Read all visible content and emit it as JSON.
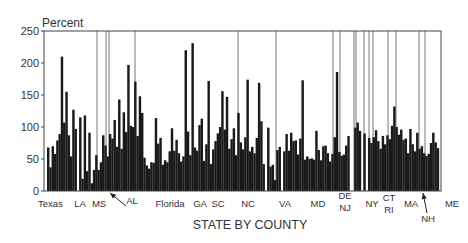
{
  "chart_data": {
    "type": "bar",
    "title": "",
    "xlabel": "STATE BY COUNTY",
    "ylabel": "Percent",
    "ylim": [
      0,
      250
    ],
    "yticks": [
      0,
      50,
      100,
      150,
      200,
      250
    ],
    "grid": false,
    "bar_color": "#1a1a1a",
    "divider_color": "#555555",
    "groups": [
      {
        "name": "Texas",
        "values": [
          68,
          37,
          70,
          58,
          79,
          89,
          210,
          107,
          155,
          87,
          54
        ]
      },
      {
        "name": "LA",
        "values": [
          127,
          97,
          0,
          115,
          19,
          118,
          31,
          91,
          12
        ]
      },
      {
        "name": "MS",
        "values": [
          33,
          56,
          33
        ]
      },
      {
        "name": "AL",
        "values": [
          45,
          87,
          71,
          54,
          89,
          82,
          111,
          69,
          143,
          66,
          123,
          92,
          197,
          102,
          100,
          171,
          86,
          148,
          122,
          52,
          40,
          35,
          45,
          44,
          114
        ]
      },
      {
        "name": "Florida",
        "values": [
          74,
          83,
          41,
          48,
          45,
          62,
          98,
          63,
          80,
          59,
          46,
          54,
          220,
          93,
          56
        ]
      },
      {
        "name": "GA",
        "values": [
          231,
          68,
          63,
          103,
          113,
          47,
          73
        ]
      },
      {
        "name": "SC",
        "values": [
          172,
          42,
          65,
          78,
          90,
          100,
          156,
          96,
          147,
          66
        ]
      },
      {
        "name": "NC",
        "values": [
          81,
          98,
          56,
          122,
          76,
          65,
          84,
          174,
          62,
          69,
          59,
          83,
          169,
          109,
          42
        ]
      },
      {
        "name": "VA",
        "values": [
          0,
          99,
          38,
          41,
          17,
          64,
          69,
          0,
          62,
          89,
          63
        ]
      },
      {
        "name": "MD",
        "values": [
          91,
          78,
          79,
          57,
          82,
          173,
          49,
          54,
          50,
          51,
          49,
          94,
          64,
          48,
          70,
          71,
          59,
          46,
          58
        ]
      },
      {
        "name": "DE",
        "values": [
          84,
          186
        ]
      },
      {
        "name": "NJ",
        "values": [
          61,
          55,
          57,
          71,
          86,
          0
        ]
      },
      {
        "name": "NY",
        "values": [
          0,
          99,
          107,
          94,
          0,
          90
        ]
      },
      {
        "name": "CT",
        "values": [
          0,
          83,
          75,
          84,
          95
        ]
      },
      {
        "name": "RI",
        "values": [
          78,
          66,
          86,
          73,
          87,
          81,
          102,
          132,
          100,
          88
        ]
      },
      {
        "name": "MA",
        "values": [
          96,
          80,
          82,
          59,
          97,
          73,
          62,
          91,
          66,
          70
        ]
      },
      {
        "name": "NH",
        "values": [
          59,
          55,
          58,
          75,
          91,
          76,
          67
        ]
      },
      {
        "name": "ME",
        "values": []
      }
    ],
    "labels": [
      {
        "text": "Texas"
      },
      {
        "text": "LA"
      },
      {
        "text": "MS"
      },
      {
        "text": "AL",
        "arrow": true
      },
      {
        "text": "Florida"
      },
      {
        "text": "GA"
      },
      {
        "text": "SC"
      },
      {
        "text": "NC"
      },
      {
        "text": "VA"
      },
      {
        "text": "MD"
      },
      {
        "text": "DE"
      },
      {
        "text": "NJ"
      },
      {
        "text": "NY"
      },
      {
        "text": "CT"
      },
      {
        "text": "RI"
      },
      {
        "text": "MA"
      },
      {
        "text": "NH",
        "arrow": true
      },
      {
        "text": "ME"
      }
    ]
  }
}
